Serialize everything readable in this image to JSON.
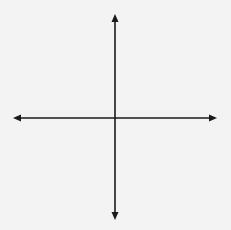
{
  "diagram": {
    "type": "coordinate_plane",
    "axes": {
      "x_label": "x",
      "y_label": "y"
    },
    "grid": {
      "x_range": [
        -8,
        8
      ],
      "y_range": [
        -8,
        8
      ],
      "minor_step": 0.5,
      "major_step": 1,
      "style": "dotted"
    },
    "points": [
      {
        "name": "A",
        "x": -3,
        "y": 2
      },
      {
        "name": "B",
        "x": -2,
        "y": -1
      },
      {
        "name": "C",
        "x": 0,
        "y": -3
      },
      {
        "name": "D",
        "x": 1,
        "y": 2
      },
      {
        "name": "E",
        "x": 3,
        "y": 4
      },
      {
        "name": "F",
        "x": 5,
        "y": 0
      }
    ]
  },
  "colors": {
    "background": "#f3f3f3",
    "axis": "#1a1a1a",
    "grid": "#9a9a9a",
    "point": "#1a1a1a"
  }
}
